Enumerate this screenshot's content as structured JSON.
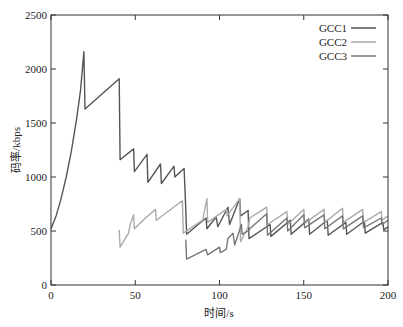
{
  "chart_data": {
    "type": "line",
    "title": "",
    "xlabel": "时间/s",
    "ylabel": "码率/kbps",
    "xlim": [
      0,
      200
    ],
    "ylim": [
      0,
      2500
    ],
    "xticks": [
      0,
      50,
      100,
      150,
      200
    ],
    "yticks": [
      0,
      500,
      1000,
      1500,
      2000,
      2500
    ],
    "grid": false,
    "legend_position": "upper right",
    "series": [
      {
        "name": "GCC1",
        "color": "#555555",
        "points": [
          [
            0,
            520
          ],
          [
            3,
            640
          ],
          [
            6,
            800
          ],
          [
            9,
            1000
          ],
          [
            12,
            1230
          ],
          [
            15,
            1520
          ],
          [
            17.5,
            1800
          ],
          [
            19.5,
            2160
          ],
          [
            20.2,
            1630
          ],
          [
            40.5,
            1910
          ],
          [
            41,
            1160
          ],
          [
            49,
            1260
          ],
          [
            49.5,
            1050
          ],
          [
            57,
            1210
          ],
          [
            57.5,
            950
          ],
          [
            65,
            1120
          ],
          [
            65.5,
            940
          ],
          [
            73,
            1100
          ],
          [
            73.5,
            1000
          ],
          [
            79,
            1080
          ],
          [
            80,
            700
          ],
          [
            80.5,
            470
          ],
          [
            92,
            620
          ],
          [
            92.5,
            520
          ],
          [
            98,
            630
          ],
          [
            99,
            540
          ],
          [
            105,
            720
          ],
          [
            106,
            560
          ],
          [
            112,
            800
          ],
          [
            112.5,
            640
          ],
          [
            117,
            690
          ],
          [
            117.5,
            430
          ],
          [
            130,
            560
          ],
          [
            130.5,
            450
          ],
          [
            142,
            600
          ],
          [
            142.5,
            470
          ],
          [
            153,
            610
          ],
          [
            153.5,
            470
          ],
          [
            164,
            600
          ],
          [
            164.5,
            460
          ],
          [
            175,
            580
          ],
          [
            175.5,
            470
          ],
          [
            186,
            590
          ],
          [
            186.5,
            480
          ],
          [
            197,
            580
          ],
          [
            197.5,
            510
          ],
          [
            200,
            540
          ]
        ]
      },
      {
        "name": "GCC2",
        "color": "#aaaaaa",
        "points": [
          [
            40.5,
            510
          ],
          [
            41,
            350
          ],
          [
            46,
            480
          ],
          [
            47,
            560
          ],
          [
            49,
            650
          ],
          [
            49.5,
            520
          ],
          [
            56,
            620
          ],
          [
            62,
            700
          ],
          [
            62.5,
            600
          ],
          [
            78,
            780
          ],
          [
            78.5,
            480
          ],
          [
            90,
            600
          ],
          [
            92.5,
            800
          ],
          [
            93,
            580
          ],
          [
            104,
            700
          ],
          [
            104.5,
            640
          ],
          [
            112,
            800
          ],
          [
            112.5,
            400
          ],
          [
            117,
            540
          ],
          [
            118,
            620
          ],
          [
            128,
            720
          ],
          [
            128.5,
            560
          ],
          [
            140,
            680
          ],
          [
            140.5,
            560
          ],
          [
            150,
            700
          ],
          [
            150.5,
            570
          ],
          [
            162,
            700
          ],
          [
            162.5,
            580
          ],
          [
            173,
            710
          ],
          [
            173.5,
            580
          ],
          [
            185,
            700
          ],
          [
            185.5,
            580
          ],
          [
            196,
            680
          ],
          [
            196.5,
            600
          ],
          [
            200,
            640
          ]
        ]
      },
      {
        "name": "GCC3",
        "color": "#777777",
        "points": [
          [
            80,
            420
          ],
          [
            80.5,
            240
          ],
          [
            92,
            330
          ],
          [
            93,
            280
          ],
          [
            100,
            350
          ],
          [
            100.5,
            300
          ],
          [
            104,
            330
          ],
          [
            105,
            430
          ],
          [
            108,
            480
          ],
          [
            109,
            370
          ],
          [
            113,
            560
          ],
          [
            113.5,
            470
          ],
          [
            117,
            500
          ],
          [
            118,
            520
          ],
          [
            128,
            660
          ],
          [
            128.5,
            460
          ],
          [
            140,
            620
          ],
          [
            140.5,
            500
          ],
          [
            150,
            650
          ],
          [
            150.5,
            530
          ],
          [
            162,
            650
          ],
          [
            162.5,
            520
          ],
          [
            173,
            640
          ],
          [
            173.5,
            520
          ],
          [
            185,
            640
          ],
          [
            185.5,
            530
          ],
          [
            196,
            620
          ],
          [
            196.5,
            560
          ],
          [
            200,
            600
          ]
        ]
      }
    ]
  },
  "legend": {
    "items": [
      {
        "label": "GCC1",
        "color": "#555555"
      },
      {
        "label": "GCC2",
        "color": "#aaaaaa"
      },
      {
        "label": "GCC3",
        "color": "#777777"
      }
    ]
  },
  "axes": {
    "xlabel": "时间/s",
    "ylabel": "码率/kbps",
    "xtick_labels": [
      "0",
      "50",
      "100",
      "150",
      "200"
    ],
    "ytick_labels": [
      "0",
      "500",
      "1000",
      "1500",
      "2000",
      "2500"
    ]
  }
}
